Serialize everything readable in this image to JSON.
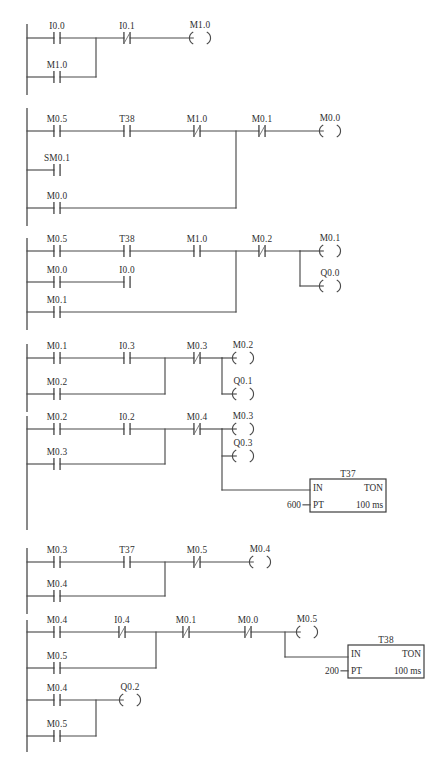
{
  "diagram": {
    "rail_x": 27,
    "geometry": {
      "contact_half_width": 9,
      "contact_bar_half_height": 6,
      "coil_half_width": 13,
      "coil_arc_height": 6,
      "label_dy": -9
    },
    "colors": {
      "wire": "#4a4a4a",
      "text": "#2e2e2e",
      "background": "#ffffff"
    },
    "networks": [
      {
        "id": "network-1",
        "rungs": [
          {
            "y": 38,
            "contacts": [
              {
                "label": "I0.0",
                "x": 57,
                "type": "no"
              },
              {
                "label": "I0.1",
                "x": 127,
                "type": "nc"
              }
            ],
            "coils": [
              {
                "label": "M1.0",
                "x": 200
              }
            ]
          },
          {
            "y": 77,
            "contacts": [
              {
                "label": "M1.0",
                "x": 57,
                "type": "no"
              }
            ],
            "coils": []
          }
        ],
        "branch_joins": [
          {
            "x": 96,
            "y_from": 38,
            "y_to": 77
          }
        ]
      },
      {
        "id": "network-2",
        "rungs": [
          {
            "y": 131,
            "contacts": [
              {
                "label": "M0.5",
                "x": 57,
                "type": "no"
              },
              {
                "label": "T38",
                "x": 127,
                "type": "no"
              },
              {
                "label": "M1.0",
                "x": 197,
                "type": "nc"
              },
              {
                "label": "M0.1",
                "x": 262,
                "type": "nc"
              }
            ],
            "coils": [
              {
                "label": "M0.0",
                "x": 330
              }
            ]
          },
          {
            "y": 170,
            "contacts": [
              {
                "label": "SM0.1",
                "x": 57,
                "type": "no"
              }
            ],
            "coils": []
          },
          {
            "y": 208,
            "contacts": [
              {
                "label": "M0.0",
                "x": 57,
                "type": "no"
              }
            ],
            "coils": []
          }
        ],
        "branch_joins": [
          {
            "x": 236,
            "y_from": 131,
            "y_to": 208
          }
        ]
      },
      {
        "id": "network-3",
        "rungs": [
          {
            "y": 251,
            "contacts": [
              {
                "label": "M0.5",
                "x": 57,
                "type": "no"
              },
              {
                "label": "T38",
                "x": 127,
                "type": "no"
              },
              {
                "label": "M1.0",
                "x": 197,
                "type": "no"
              },
              {
                "label": "M0.2",
                "x": 262,
                "type": "nc"
              }
            ],
            "coils": [
              {
                "label": "M0.1",
                "x": 330
              }
            ]
          },
          {
            "y": 282,
            "contacts": [
              {
                "label": "M0.0",
                "x": 57,
                "type": "no"
              },
              {
                "label": "I0.0",
                "x": 127,
                "type": "no"
              }
            ],
            "coils": []
          },
          {
            "y": 312,
            "contacts": [
              {
                "label": "M0.1",
                "x": 57,
                "type": "no"
              }
            ],
            "coils": []
          }
        ],
        "branch_joins": [
          {
            "x": 236,
            "y_from": 251,
            "y_to": 312
          }
        ],
        "coil_stack": {
          "x_split": 300,
          "y_top": 251,
          "extra_coils": [
            {
              "label": "Q0.0",
              "x": 330,
              "y": 286
            }
          ]
        }
      },
      {
        "id": "network-4",
        "rungs": [
          {
            "y": 358,
            "contacts": [
              {
                "label": "M0.1",
                "x": 57,
                "type": "no"
              },
              {
                "label": "I0.3",
                "x": 127,
                "type": "no"
              },
              {
                "label": "M0.3",
                "x": 197,
                "type": "nc"
              }
            ],
            "coils": [
              {
                "label": "M0.2",
                "x": 243
              }
            ]
          },
          {
            "y": 394,
            "contacts": [
              {
                "label": "M0.2",
                "x": 57,
                "type": "no"
              }
            ],
            "coils": []
          }
        ],
        "branch_joins": [
          {
            "x": 165,
            "y_from": 358,
            "y_to": 394
          }
        ],
        "coil_stack": {
          "x_split": 222,
          "y_top": 358,
          "extra_coils": [
            {
              "label": "Q0.1",
              "x": 243,
              "y": 394
            }
          ]
        }
      },
      {
        "id": "network-5",
        "rungs": [
          {
            "y": 429,
            "contacts": [
              {
                "label": "M0.2",
                "x": 57,
                "type": "no"
              },
              {
                "label": "I0.2",
                "x": 127,
                "type": "no"
              },
              {
                "label": "M0.4",
                "x": 197,
                "type": "nc"
              }
            ],
            "coils": [
              {
                "label": "M0.3",
                "x": 243
              }
            ]
          },
          {
            "y": 464,
            "contacts": [
              {
                "label": "M0.3",
                "x": 57,
                "type": "no"
              }
            ],
            "coils": []
          }
        ],
        "branch_joins": [
          {
            "x": 165,
            "y_from": 429,
            "y_to": 464
          }
        ],
        "coil_stack": {
          "x_split": 222,
          "y_top": 429,
          "extra_coils": [
            {
              "label": "Q0.3",
              "x": 243,
              "y": 456
            }
          ]
        },
        "timer": {
          "name": "T37",
          "in_label": "IN",
          "type_label": "TON",
          "pt_label": "PT",
          "pt_value": "600",
          "time_base": "100 ms",
          "box_x": 310,
          "box_y": 479,
          "box_w": 76,
          "box_h": 33,
          "feed_from_x": 222,
          "feed_y": 490
        }
      },
      {
        "id": "network-6",
        "rungs": [
          {
            "y": 562,
            "contacts": [
              {
                "label": "M0.3",
                "x": 57,
                "type": "no"
              },
              {
                "label": "T37",
                "x": 127,
                "type": "no"
              },
              {
                "label": "M0.5",
                "x": 197,
                "type": "nc"
              }
            ],
            "coils": [
              {
                "label": "M0.4",
                "x": 260
              }
            ]
          },
          {
            "y": 596,
            "contacts": [
              {
                "label": "M0.4",
                "x": 57,
                "type": "no"
              }
            ],
            "coils": []
          }
        ],
        "branch_joins": [
          {
            "x": 165,
            "y_from": 562,
            "y_to": 596
          }
        ]
      },
      {
        "id": "network-7",
        "rungs": [
          {
            "y": 632,
            "contacts": [
              {
                "label": "M0.4",
                "x": 57,
                "type": "no"
              },
              {
                "label": "I0.4",
                "x": 122,
                "type": "nc"
              },
              {
                "label": "M0.1",
                "x": 186,
                "type": "nc"
              },
              {
                "label": "M0.0",
                "x": 248,
                "type": "nc"
              }
            ],
            "coils": [
              {
                "label": "M0.5",
                "x": 307
              }
            ]
          },
          {
            "y": 668,
            "contacts": [
              {
                "label": "M0.5",
                "x": 57,
                "type": "no"
              }
            ],
            "coils": []
          }
        ],
        "branch_joins": [
          {
            "x": 156,
            "y_from": 632,
            "y_to": 668
          }
        ],
        "timer": {
          "name": "T38",
          "in_label": "IN",
          "type_label": "TON",
          "pt_label": "PT",
          "pt_value": "200",
          "time_base": "100 ms",
          "box_x": 348,
          "box_y": 645,
          "box_w": 76,
          "box_h": 33,
          "feed_from_x": 285,
          "feed_y": 657
        }
      },
      {
        "id": "network-8",
        "rungs": [
          {
            "y": 700,
            "contacts": [
              {
                "label": "M0.4",
                "x": 57,
                "type": "no"
              }
            ],
            "coils": [
              {
                "label": "Q0.2",
                "x": 130
              }
            ]
          },
          {
            "y": 736,
            "contacts": [
              {
                "label": "M0.5",
                "x": 57,
                "type": "no"
              }
            ],
            "coils": []
          }
        ],
        "branch_joins": [
          {
            "x": 96,
            "y_from": 700,
            "y_to": 736
          }
        ]
      }
    ],
    "rail_segments": [
      {
        "y_from": 24,
        "y_to": 95
      },
      {
        "y_from": 108,
        "y_to": 226
      },
      {
        "y_from": 238,
        "y_to": 330
      },
      {
        "y_from": 344,
        "y_to": 412
      },
      {
        "y_from": 416,
        "y_to": 530
      },
      {
        "y_from": 548,
        "y_to": 614
      },
      {
        "y_from": 620,
        "y_to": 752
      }
    ]
  }
}
